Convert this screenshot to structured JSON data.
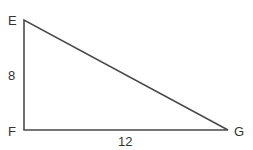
{
  "diagram": {
    "type": "right-triangle",
    "vertices": {
      "E": {
        "label": "E"
      },
      "F": {
        "label": "F"
      },
      "G": {
        "label": "G"
      }
    },
    "sides": {
      "EF": {
        "label": "8"
      },
      "FG": {
        "label": "12"
      }
    },
    "right_angle_at": "F",
    "stroke_color": "#4a4a4a"
  }
}
